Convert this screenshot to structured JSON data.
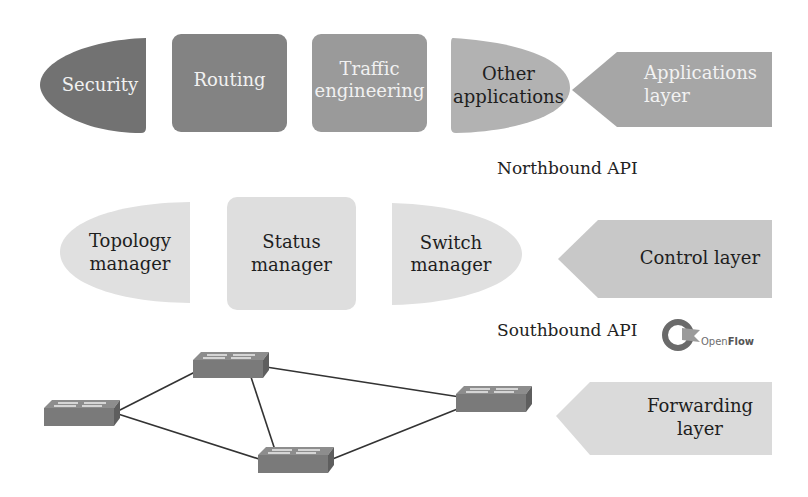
{
  "applications_layer": {
    "boxes": [
      {
        "label_line1": "Security",
        "label_line2": "",
        "color": "#727272",
        "text_color": "#efefef",
        "shape": "leaf-left"
      },
      {
        "label_line1": "Routing",
        "label_line2": "",
        "color": "#838383",
        "text_color": "#efefef",
        "shape": "rounded-rect"
      },
      {
        "label_line1": "Traffic",
        "label_line2": "engineering",
        "color": "#9a9a9a",
        "text_color": "#f2f2f2",
        "shape": "rounded-rect"
      },
      {
        "label_line1": "Other",
        "label_line2": "applications",
        "color": "#b2b2b2",
        "text_color": "#1e1e1e",
        "shape": "leaf-right"
      }
    ],
    "arrow": {
      "label_line1": "Applications",
      "label_line2": "layer",
      "color": "#a6a6a6",
      "text_color": "#f2f2f2"
    }
  },
  "northbound_api": {
    "label": "Northbound API"
  },
  "control_layer": {
    "boxes": [
      {
        "label_line1": "Topology",
        "label_line2": "manager",
        "color": "#e0e0e0",
        "shape": "leaf-left"
      },
      {
        "label_line1": "Status",
        "label_line2": "manager",
        "color": "#dedede",
        "shape": "rounded-rect"
      },
      {
        "label_line1": "Switch",
        "label_line2": "manager",
        "color": "#e0e0e0",
        "shape": "leaf-right"
      }
    ],
    "arrow": {
      "label": "Control layer",
      "color": "#c8c8c8",
      "text_color": "#1e1e1e"
    }
  },
  "southbound_api": {
    "label": "Southbound API"
  },
  "openflow_logo": {
    "text_open": "Open",
    "text_flow": "Flow"
  },
  "forwarding_layer": {
    "switches": [
      {
        "id": "s1",
        "x": 83,
        "y": 413
      },
      {
        "id": "s2",
        "x": 230,
        "y": 365
      },
      {
        "id": "s3",
        "x": 296,
        "y": 458
      },
      {
        "id": "s4",
        "x": 489,
        "y": 399
      }
    ],
    "links": [
      [
        "s1",
        "s2"
      ],
      [
        "s1",
        "s3"
      ],
      [
        "s2",
        "s3"
      ],
      [
        "s2",
        "s4"
      ],
      [
        "s3",
        "s4"
      ]
    ],
    "arrow": {
      "label_line1": "Forwarding",
      "label_line2": "layer",
      "color": "#dadada",
      "text_color": "#1e1e1e"
    }
  }
}
